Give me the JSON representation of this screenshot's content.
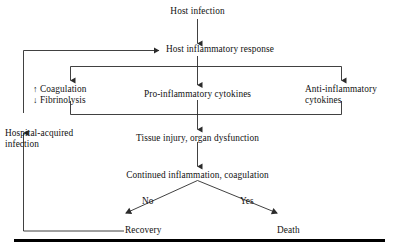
{
  "diagram": {
    "type": "flowchart",
    "line_color": "#2b2b2b",
    "text_color": "#111111",
    "rule_color": "#000000",
    "nodes": {
      "host_infection": "Host infection",
      "host_inflammatory_response": "Host inflammatory response",
      "coagulation": "Coagulation",
      "fibrinolysis": "Fibrinolysis",
      "coagulation_arrow": "↑",
      "fibrinolysis_arrow": "↓",
      "pro_inflammatory": "Pro-inflammatory cytokines",
      "anti_inflammatory_line1": "Anti-inflammatory",
      "anti_inflammatory_line2": "cytokines",
      "tissue_injury": "Tissue injury, organ dysfunction",
      "continued_inflammation": "Continued inflammation, coagulation",
      "hospital_acquired_line1": "Hospital-acquired",
      "hospital_acquired_line2": "infection",
      "recovery": "Recovery",
      "death": "Death"
    },
    "edge_labels": {
      "no": "No",
      "yes": "Yes"
    }
  }
}
